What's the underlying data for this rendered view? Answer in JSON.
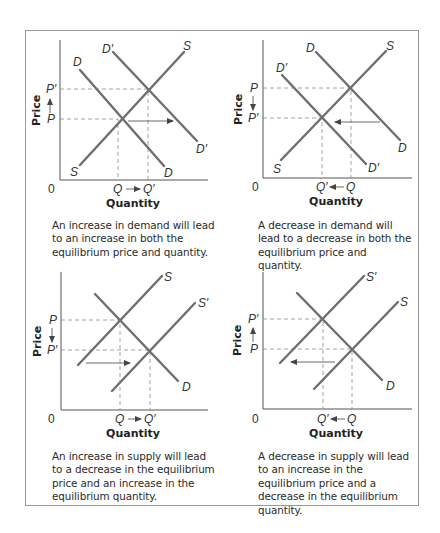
{
  "figure": {
    "panels": [
      {
        "id": "demand-increase",
        "y_axis_label": "Price",
        "x_axis_label": "Quantity",
        "origin_label": "0",
        "price_top_label": "P′",
        "price_bottom_label": "P",
        "price_arrow": "up",
        "qty_left_label": "Q",
        "qty_right_label": "Q′",
        "qty_arrow": "right",
        "curves": [
          {
            "label_start": "D",
            "label_end": "D"
          },
          {
            "label_start": "D′",
            "label_end": "D′"
          },
          {
            "label_start": "S",
            "label_end": "S"
          }
        ],
        "caption": "An increase in demand will lead to an increase in both the equilibrium price and quantity."
      },
      {
        "id": "demand-decrease",
        "y_axis_label": "Price",
        "x_axis_label": "Quantity",
        "origin_label": "0",
        "price_top_label": "P",
        "price_bottom_label": "P′",
        "price_arrow": "down",
        "qty_left_label": "Q′",
        "qty_right_label": "Q",
        "qty_arrow": "left",
        "curves": [
          {
            "label_start": "D",
            "label_end": "D"
          },
          {
            "label_start": "D′",
            "label_end": "D′"
          },
          {
            "label_start": "S",
            "label_end": "S"
          }
        ],
        "caption": "A decrease in demand will lead to a decrease in both the equilibrium price and quantity."
      },
      {
        "id": "supply-increase",
        "y_axis_label": "Price",
        "x_axis_label": "Quantity",
        "origin_label": "0",
        "price_top_label": "P",
        "price_bottom_label": "P′",
        "price_arrow": "down",
        "qty_left_label": "Q",
        "qty_right_label": "Q′",
        "qty_arrow": "right",
        "curves": [
          {
            "label_end": "S"
          },
          {
            "label_end": "S′"
          },
          {
            "label_end": "D"
          }
        ],
        "caption": "An increase in supply will lead to a decrease in the equilibrium price and an increase in the equilibrium quantity."
      },
      {
        "id": "supply-decrease",
        "y_axis_label": "Price",
        "x_axis_label": "Quantity",
        "origin_label": "0",
        "price_top_label": "P′",
        "price_bottom_label": "P",
        "price_arrow": "up",
        "qty_left_label": "Q′",
        "qty_right_label": "Q",
        "qty_arrow": "left",
        "curves": [
          {
            "label_end": "S′"
          },
          {
            "label_end": "S"
          },
          {
            "label_end": "D"
          }
        ],
        "caption": "A decrease in supply will lead to an increase in the equilibrium price and a decrease in the equilibrium quantity."
      }
    ],
    "colors": {
      "curve": "#6e6e6e",
      "axis": "#555555",
      "dashed": "#8a8a8a",
      "frame": "#9a9a9a",
      "text": "#2a2a2a"
    }
  }
}
